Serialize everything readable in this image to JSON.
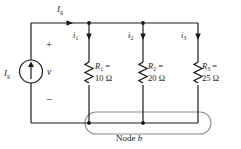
{
  "figure": {
    "background_color": "#ffffff",
    "wire_color": "#1a1a1a",
    "highlight_color": "#8c8c8c",
    "text_color": "#1a1a1a"
  },
  "source": {
    "symbol": "current-source",
    "label_base": "I",
    "label_sub": "g",
    "arrow_direction": "up"
  },
  "branch_current": {
    "label_base": "I",
    "label_sub": "g",
    "arrow_direction": "right"
  },
  "voltage": {
    "label": "v",
    "plus": "+",
    "minus": "−"
  },
  "currents": [
    {
      "label_base": "i",
      "label_sub": "1",
      "arrow_direction": "down"
    },
    {
      "label_base": "i",
      "label_sub": "2",
      "arrow_direction": "down"
    },
    {
      "label_base": "i",
      "label_sub": "3",
      "arrow_direction": "down"
    }
  ],
  "resistors": [
    {
      "label_base": "R",
      "label_sub": "1",
      "equals": "=",
      "value": "10 Ω"
    },
    {
      "label_base": "R",
      "label_sub": "2",
      "equals": "=",
      "value": "20 Ω"
    },
    {
      "label_base": "R",
      "label_sub": "3",
      "equals": "=",
      "value": "25 Ω"
    }
  ],
  "node": {
    "label_text": "Node",
    "label_name": "b"
  }
}
